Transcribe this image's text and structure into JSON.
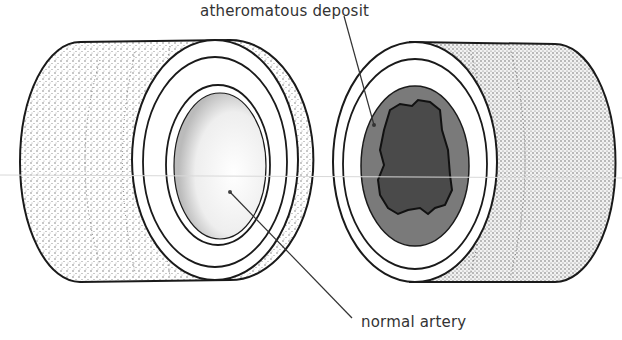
{
  "diagram": {
    "labels": {
      "atheromatous_deposit": "atheromatous deposit",
      "normal_artery": "normal artery"
    },
    "colors": {
      "outline": "#1a1a1a",
      "stipple": "#555555",
      "deposit_fill": "#7a7a7a",
      "plaque_fill": "#4a4a4a",
      "leader_line": "#333333",
      "background": "#ffffff"
    },
    "cylinders": [
      {
        "name": "normal-artery-section",
        "lumen": "open"
      },
      {
        "name": "diseased-artery-section",
        "lumen": "narrowed-by-deposit"
      }
    ]
  }
}
